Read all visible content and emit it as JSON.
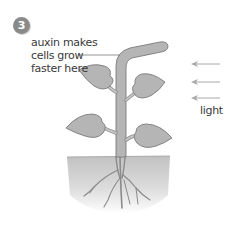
{
  "step": {
    "number": "3"
  },
  "annotation": {
    "lines": [
      "auxin makes",
      "cells grow",
      "faster here"
    ]
  },
  "light_label": "light",
  "arrows": {
    "count": 3,
    "direction": "left"
  },
  "colors": {
    "badge": "#8a8a8a",
    "plant_fill": "#b5b5b5",
    "plant_stroke": "#7a7a7a",
    "soil_top": "#c2c2c2",
    "soil_bottom": "#ffffff",
    "arrow": "#a8a8a8",
    "text": "#3a3a3a"
  }
}
